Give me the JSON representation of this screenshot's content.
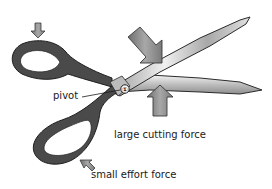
{
  "diagram": {
    "type": "scissors lever diagram",
    "object": "scissors",
    "labels": {
      "pivot": "pivot",
      "large_force": "large cutting force",
      "small_force": "small effort force"
    },
    "pivot_marker": "①",
    "colors": {
      "outline": "#2a2a2a",
      "handle": "#4a4a4a",
      "blade_light": "#e8e8e8",
      "blade_dark": "#8c8c8c",
      "arrow": "#8a8a8a",
      "text": "#1a1a1a"
    }
  }
}
